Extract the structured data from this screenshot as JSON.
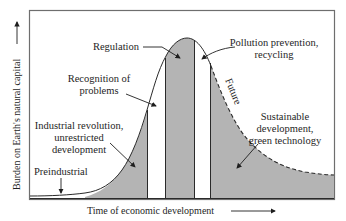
{
  "diagram": {
    "type": "conceptual-curve",
    "axes": {
      "x_label": "Time of economic development",
      "y_label": "Burden on Earth's natural capital"
    },
    "colors": {
      "fill": "#b4b4b4",
      "line": "#2a2a2a",
      "frame": "#6e6e6e",
      "background": "#ffffff"
    },
    "curve_label": "Future",
    "annotations": [
      {
        "id": "preindustrial",
        "lines": [
          "Preindustrial"
        ]
      },
      {
        "id": "industrial",
        "lines": [
          "Industrial revolution,",
          "unrestricted",
          "development"
        ]
      },
      {
        "id": "recognition",
        "lines": [
          "Recognition of",
          "problems"
        ]
      },
      {
        "id": "regulation",
        "lines": [
          "Regulation"
        ]
      },
      {
        "id": "pollution",
        "lines": [
          "Pollution prevention,",
          "recycling"
        ]
      },
      {
        "id": "sustainable",
        "lines": [
          "Sustainable",
          "development,",
          "green technology"
        ]
      }
    ],
    "phases": [
      {
        "name": "Preindustrial",
        "shaded": false
      },
      {
        "name": "Industrial revolution, unrestricted development",
        "shaded": true
      },
      {
        "name": "Recognition of problems",
        "shaded": false
      },
      {
        "name": "Regulation",
        "shaded": true
      },
      {
        "name": "Pollution prevention, recycling",
        "shaded": false
      },
      {
        "name": "Sustainable development, green technology",
        "shaded": true
      }
    ]
  }
}
